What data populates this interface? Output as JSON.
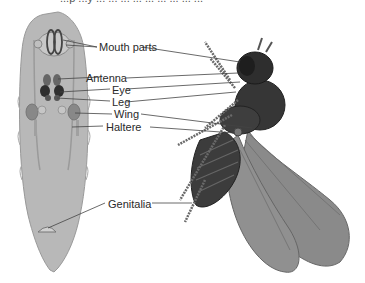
{
  "caption_fragment": "...p ...y ... ... ... ... ... ... ... ... ...",
  "labels": {
    "mouth_parts": "Mouth parts",
    "antenna": "Antenna",
    "eye": "Eye",
    "leg": "Leg",
    "wing": "Wing",
    "haltere": "Haltere",
    "genitalia": "Genitalia"
  },
  "figures": {
    "left": "larva-imaginal-discs",
    "right": "adult-fly"
  },
  "colors": {
    "larva_body": "#b5b5b5",
    "disc_dark": "#3a3a3a",
    "fly_body": "#3c3c3c",
    "wing": "#8a8a8a",
    "line": "#444444"
  }
}
